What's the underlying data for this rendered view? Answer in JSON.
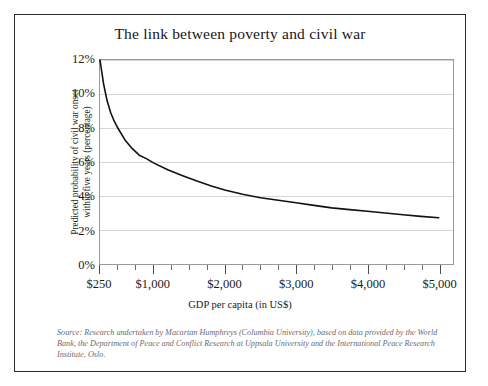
{
  "figure": {
    "title": "The link between poverty and civil war",
    "source_note": "Source: Research undertaken by Macartan Humphreys (Columbia University), based on data provided by the World Bank, the Department of Peace and Conflict Research at Uppsala University and the International Peace Research Institute, Oslo."
  },
  "axes": {
    "ylabel_line1": "Predicted probability of civil war onset",
    "ylabel_line2": "within five years (percentage)",
    "xlabel": "GDP per capita (in US$)",
    "ytick_labels": [
      "12%",
      "10%",
      "8%",
      "6%",
      "4%",
      "2%",
      "0%"
    ],
    "xtick_labels": [
      "$250",
      "$1,000",
      "$2,000",
      "$3,000",
      "$4,000",
      "$5,000"
    ]
  },
  "colors": {
    "curve": "#111111",
    "grid": "#d6d6d6",
    "frame": "#2b2b2b",
    "plot_border": "#9a9a9a",
    "source_text": "#6b6b72"
  },
  "chart_data": {
    "type": "line",
    "title": "The link between poverty and civil war",
    "xlabel": "GDP per capita (in US$)",
    "ylabel": "Predicted probability of civil war onset within five years (percentage)",
    "xlim": [
      250,
      5200
    ],
    "ylim": [
      0,
      12
    ],
    "xticks": [
      250,
      1000,
      2000,
      3000,
      4000,
      5000
    ],
    "xtick_labels": [
      "$250",
      "$1,000",
      "$2,000",
      "$3,000",
      "$4,000",
      "$5,000"
    ],
    "yticks": [
      0,
      2,
      4,
      6,
      8,
      10,
      12
    ],
    "ytick_labels": [
      "0%",
      "2%",
      "4%",
      "6%",
      "8%",
      "10%",
      "12%"
    ],
    "grid": "horizontal",
    "legend": "none",
    "series": [
      {
        "name": "Predicted probability of civil war onset within five years",
        "x": [
          250,
          300,
          350,
          400,
          450,
          500,
          600,
          700,
          800,
          900,
          1000,
          1200,
          1400,
          1600,
          1800,
          2000,
          2250,
          2500,
          2750,
          3000,
          3250,
          3500,
          3750,
          4000,
          4250,
          4500,
          4750,
          5000
        ],
        "y": [
          12.0,
          10.6,
          9.6,
          8.9,
          8.4,
          8.0,
          7.3,
          6.8,
          6.4,
          6.2,
          5.95,
          5.55,
          5.2,
          4.9,
          4.6,
          4.35,
          4.1,
          3.9,
          3.75,
          3.6,
          3.45,
          3.3,
          3.2,
          3.1,
          3.0,
          2.9,
          2.8,
          2.72
        ],
        "units": "percent"
      }
    ]
  }
}
